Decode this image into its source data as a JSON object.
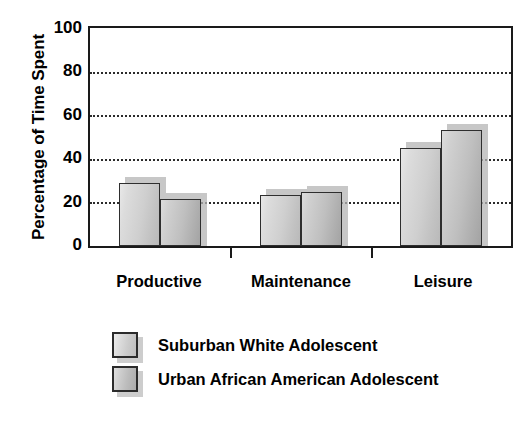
{
  "chart_data": {
    "type": "bar",
    "title": "",
    "subtitle": "",
    "xlabel": "",
    "ylabel": "Percentage of Time Spent",
    "categories": [
      "Productive",
      "Maintenance",
      "Leisure"
    ],
    "series": [
      {
        "name": "Suburban White Adolescent",
        "values": [
          29,
          23.5,
          45
        ]
      },
      {
        "name": "Urban African American Adolescent",
        "values": [
          21.5,
          25,
          53
        ]
      }
    ],
    "ylim": [
      0,
      100
    ],
    "yticks": [
      0,
      20,
      40,
      60,
      80,
      100
    ],
    "ytick_labels": [
      "0",
      "20",
      "40",
      "60",
      "80",
      "100"
    ],
    "grid": true,
    "grid_style": "dotted",
    "grid_axis": "y",
    "legend_position": "bottom-left",
    "colors": {
      "series0_fill": "#cfcfcf",
      "series1_fill": "#bcbcbc",
      "bar_border": "#2e2e2e",
      "shadow": "#b4b4b4",
      "axis": "#1a1a1a",
      "grid": "#2b2b2b",
      "text": "#000000",
      "background": "#ffffff"
    }
  },
  "legend": {
    "items": [
      {
        "label": "Suburban White Adolescent",
        "swatch": "legend-swatch-series-0"
      },
      {
        "label": "Urban African American Adolescent",
        "swatch": "legend-swatch-series-1"
      }
    ]
  }
}
